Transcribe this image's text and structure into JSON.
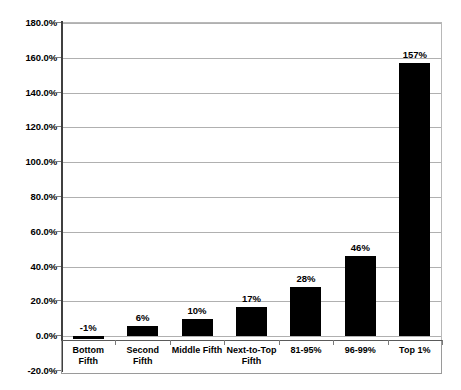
{
  "chart_data": {
    "type": "bar",
    "title": "",
    "xlabel": "",
    "ylabel": "",
    "categories": [
      "Bottom Fifth",
      "Second Fifth",
      "Middle Fifth",
      "Next-to-Top Fifth",
      "81-95%",
      "96-99%",
      "Top 1%"
    ],
    "values": [
      -1,
      6,
      10,
      17,
      28,
      46,
      157
    ],
    "data_labels": [
      "-1%",
      "6%",
      "10%",
      "17%",
      "28%",
      "46%",
      "157%"
    ],
    "ylim": [
      -20,
      180
    ],
    "ytick_step": 20,
    "ytick_labels": [
      "180.0%",
      "160.0%",
      "140.0%",
      "120.0%",
      "100.0%",
      "80.0%",
      "60.0%",
      "40.0%",
      "20.0%",
      "0.0%",
      "-20.0%"
    ],
    "ytick_values": [
      180,
      160,
      140,
      120,
      100,
      80,
      60,
      40,
      20,
      0,
      -20
    ],
    "grid": true,
    "grid_axis": "y",
    "legend": "none",
    "bar_color": "#000000",
    "gridline_color": "#b0b0b0",
    "axis_color": "#404040",
    "background_color": "#ffffff"
  }
}
